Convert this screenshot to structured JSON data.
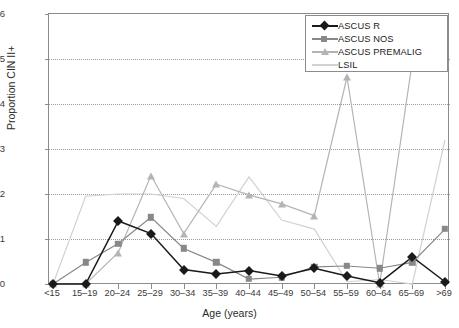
{
  "axes": {
    "y_title": "Proportion CIN II+",
    "x_title": "Age (years)",
    "y_ticks": [
      "0",
      "0.1",
      "0.2",
      "0.3",
      "0.4",
      "0.5",
      "0.6"
    ],
    "x_ticks": [
      "<15",
      "15–19",
      "20–24",
      "25–29",
      "30–34",
      "35–39",
      "40–44",
      "45–49",
      "50–54",
      "55–59",
      "60–64",
      "65–69",
      ">69"
    ]
  },
  "legend": {
    "items": [
      {
        "label": "ASCUS R",
        "marker": "diamond",
        "color": "#1a1a1a"
      },
      {
        "label": "ASCUS NOS",
        "marker": "square",
        "color": "#888888"
      },
      {
        "label": "ASCUS PREMALIG",
        "marker": "triangle",
        "color": "#b4b4b4"
      },
      {
        "label": "LSIL",
        "marker": "line",
        "color": "#d2d2d2"
      }
    ]
  },
  "chart_data": {
    "type": "line",
    "title": "",
    "xlabel": "Age (years)",
    "ylabel": "Proportion CIN II+",
    "ylim": [
      0,
      0.6
    ],
    "grid": true,
    "legend_position": "top-right",
    "categories": [
      "<15",
      "15–19",
      "20–24",
      "25–29",
      "30–34",
      "35–39",
      "40–44",
      "45–49",
      "50–54",
      "55–59",
      "60–64",
      "65–69",
      ">69"
    ],
    "series": [
      {
        "name": "ASCUS R",
        "color": "#1a1a1a",
        "marker": "diamond",
        "values": [
          0.0,
          0.0,
          0.14,
          0.112,
          0.032,
          0.022,
          0.03,
          0.018,
          0.035,
          0.018,
          0.003,
          0.06,
          0.005
        ]
      },
      {
        "name": "ASCUS NOS",
        "color": "#888888",
        "marker": "square",
        "values": [
          0.0,
          0.048,
          0.09,
          0.148,
          0.079,
          0.048,
          0.011,
          0.015,
          0.038,
          0.04,
          0.035,
          0.048,
          0.122
        ]
      },
      {
        "name": "ASCUS PREMALIG",
        "color": "#b4b4b4",
        "marker": "triangle",
        "values": [
          0.0,
          0.0,
          0.07,
          0.241,
          0.112,
          0.222,
          0.198,
          0.178,
          0.152,
          0.46,
          0.0,
          0.495,
          0.495
        ]
      },
      {
        "name": "LSIL",
        "color": "#d2d2d2",
        "marker": "none",
        "values": [
          0.0,
          0.195,
          0.2,
          0.2,
          0.19,
          0.128,
          0.238,
          0.142,
          0.122,
          0.005,
          0.01,
          0.0,
          0.32
        ]
      }
    ]
  }
}
